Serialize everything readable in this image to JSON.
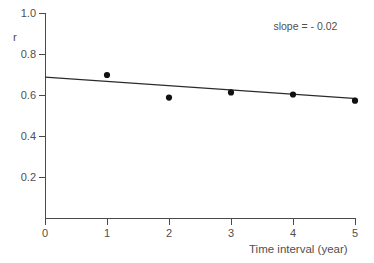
{
  "chart_data": {
    "type": "scatter",
    "title": "",
    "xlabel": "Time interval (year)",
    "ylabel": "r",
    "xlim": [
      0,
      5
    ],
    "ylim": [
      0,
      1.0
    ],
    "grid": false,
    "legend": "none",
    "x": [
      1,
      2,
      3,
      4,
      5
    ],
    "values": [
      0.7,
      0.59,
      0.615,
      0.605,
      0.575
    ],
    "series": [
      {
        "name": "r",
        "x": [
          1,
          2,
          3,
          4,
          5
        ],
        "values": [
          0.7,
          0.59,
          0.615,
          0.605,
          0.575
        ]
      }
    ],
    "xticks": [
      "0",
      "1",
      "2",
      "3",
      "4",
      "5"
    ],
    "xtick_values": [
      0,
      1,
      2,
      3,
      4,
      5
    ],
    "yticks": [
      "0.2",
      "0.4",
      "0.6",
      "0.8",
      "1.0"
    ],
    "ytick_values": [
      0.2,
      0.4,
      0.6,
      0.8,
      1.0
    ],
    "trendline": {
      "x_start": 0,
      "y_start": 0.69,
      "x_end": 5,
      "y_end": 0.585,
      "slope": -0.02
    },
    "annotations": [
      {
        "text": "slope = - 0.02",
        "x": 4.2,
        "y": 0.92
      }
    ],
    "colors": {
      "point": "#111111",
      "line": "#2b2b2b",
      "axis": "#4a4a4a",
      "text": "#4f4f4f",
      "background": "#ffffff"
    }
  }
}
